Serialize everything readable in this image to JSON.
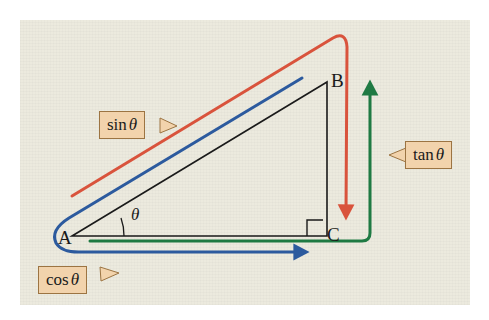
{
  "figure": {
    "background_color": "#ffffff",
    "paper_color": "#eceade"
  },
  "colors": {
    "sin": "#d9533c",
    "cos": "#2c5a9e",
    "tan": "#1f7a43",
    "triangle": "#1a1a1a",
    "callout_fill": "#f2d3ac",
    "callout_border": "#9c7442"
  },
  "vertices": [
    {
      "name": "A",
      "label": "A",
      "x": 72,
      "y": 236
    },
    {
      "name": "B",
      "label": "B",
      "x": 327,
      "y": 82
    },
    {
      "name": "C",
      "label": "C",
      "x": 327,
      "y": 236
    }
  ],
  "angle": {
    "label": "θ",
    "at_vertex": "A"
  },
  "right_angle": {
    "at_vertex": "C",
    "marker": "square"
  },
  "callouts": [
    {
      "name": "sin",
      "function": "sin",
      "argument": "θ",
      "text": "sin θ",
      "tail_side": "right",
      "color": "#d9533c"
    },
    {
      "name": "cos",
      "function": "cos",
      "argument": "θ",
      "text": "cos θ",
      "tail_side": "right",
      "color": "#2c5a9e"
    },
    {
      "name": "tan",
      "function": "tan",
      "argument": "θ",
      "text": "tan θ",
      "tail_side": "left",
      "color": "#1f7a43"
    }
  ],
  "segments": [
    {
      "name": "sin-segment",
      "color": "#d9533c",
      "arrow": "end",
      "describes": "opposite side BC"
    },
    {
      "name": "cos-segment",
      "color": "#2c5a9e",
      "arrow": "end",
      "describes": "adjacent side AC"
    },
    {
      "name": "tan-segment",
      "color": "#1f7a43",
      "arrow": "end",
      "describes": "tangent length"
    }
  ]
}
